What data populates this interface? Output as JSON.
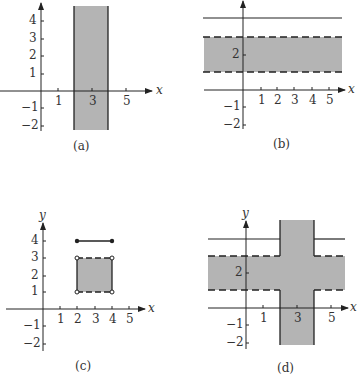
{
  "figure": {
    "colors": {
      "shade": "#b4b4b4",
      "ink": "#222222",
      "text": "#333333"
    },
    "panels": [
      {
        "id": "a",
        "caption": "(a)",
        "axis_label_x": "x",
        "x_ticks": [
          "1",
          "3",
          "5"
        ],
        "y_ticks": [
          "4",
          "3",
          "2",
          "1",
          "−1",
          "−2"
        ],
        "region": "vertical strip 2 ≤ x ≤ 4, solid boundaries"
      },
      {
        "id": "b",
        "caption": "(b)",
        "axis_label_x": "x",
        "x_ticks": [
          "1",
          "2",
          "3",
          "4",
          "5"
        ],
        "y_ticks": [
          "2",
          "−1",
          "−2"
        ],
        "region": "horizontal strip 1 < y < 3 with dashed boundaries, plus solid line y = 4"
      },
      {
        "id": "c",
        "caption": "(c)",
        "axis_label_x": "x",
        "axis_label_y": "y",
        "x_ticks": [
          "1",
          "2",
          "3",
          "4",
          "5"
        ],
        "y_ticks": [
          "4",
          "3",
          "2",
          "1",
          "−1",
          "−2"
        ],
        "region": "square 2 ≤ x ≤ 4, 1 < y < 3 (solid vertical sides, dashed horizontal sides, open corners) plus segment y = 4, 2 ≤ x ≤ 4 with closed endpoints"
      },
      {
        "id": "d",
        "caption": "(d)",
        "axis_label_x": "x",
        "axis_label_y": "y",
        "x_ticks": [
          "1",
          "3",
          "5"
        ],
        "y_ticks": [
          "2",
          "−1",
          "−2"
        ],
        "region": "union of vertical strip 2 ≤ x ≤ 4 and horizontal strip 1 < y < 3, plus line y = 4 outside the vertical strip"
      }
    ]
  }
}
